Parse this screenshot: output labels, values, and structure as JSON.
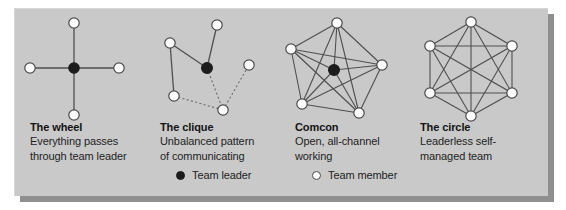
{
  "figure": {
    "background_color": "#c9c9c9",
    "shadow_color": "#8f8f8f",
    "page_color": "#ffffff",
    "node_fill_member": "#fbfbfb",
    "node_fill_leader": "#1c1c1c",
    "node_stroke": "#4a4a4a",
    "edge_color": "#4f4f4f"
  },
  "columns": [
    {
      "id": "wheel",
      "title": "The wheel",
      "description_lines": [
        "Everything passes",
        "through team leader"
      ],
      "diagram": {
        "name": "wheel-diagram",
        "leader_count": 1,
        "member_count": 4,
        "edge_style": "solid",
        "nodes": [
          {
            "id": "c",
            "type": "leader",
            "x": 60,
            "y": 60
          },
          {
            "id": "n",
            "type": "member",
            "x": 60,
            "y": 15
          },
          {
            "id": "e",
            "type": "member",
            "x": 105,
            "y": 60
          },
          {
            "id": "s",
            "type": "member",
            "x": 60,
            "y": 107
          },
          {
            "id": "w",
            "type": "member",
            "x": 16,
            "y": 60
          }
        ],
        "edges": [
          {
            "from": "c",
            "to": "n",
            "style": "solid"
          },
          {
            "from": "c",
            "to": "e",
            "style": "solid"
          },
          {
            "from": "c",
            "to": "s",
            "style": "solid"
          },
          {
            "from": "c",
            "to": "w",
            "style": "solid"
          }
        ]
      }
    },
    {
      "id": "clique",
      "title": "The clique",
      "description_lines": [
        "Unbalanced pattern",
        "of communicating"
      ],
      "diagram": {
        "name": "clique-diagram",
        "leader_count": 1,
        "member_count": 5,
        "edge_style": "mixed",
        "nodes": [
          {
            "id": "L",
            "type": "leader",
            "x": 60,
            "y": 60
          },
          {
            "id": "a",
            "type": "member",
            "x": 70,
            "y": 17
          },
          {
            "id": "b",
            "type": "member",
            "x": 23,
            "y": 35
          },
          {
            "id": "c",
            "type": "member",
            "x": 27,
            "y": 88
          },
          {
            "id": "d",
            "type": "member",
            "x": 76,
            "y": 102
          },
          {
            "id": "e",
            "type": "member",
            "x": 102,
            "y": 57
          }
        ],
        "edges": [
          {
            "from": "L",
            "to": "a",
            "style": "solid"
          },
          {
            "from": "L",
            "to": "b",
            "style": "solid"
          },
          {
            "from": "b",
            "to": "c",
            "style": "solid"
          },
          {
            "from": "L",
            "to": "d",
            "style": "dotted"
          },
          {
            "from": "c",
            "to": "d",
            "style": "dotted"
          },
          {
            "from": "d",
            "to": "e",
            "style": "dotted"
          }
        ]
      }
    },
    {
      "id": "comcon",
      "title": "Comcon",
      "description_lines": [
        "Open, all-channel",
        "working"
      ],
      "diagram": {
        "name": "comcon-diagram",
        "leader_count": 1,
        "member_count": 5,
        "edge_style": "solid",
        "fully_connected": true,
        "nodes": [
          {
            "id": "L",
            "type": "leader",
            "x": 54,
            "y": 62
          },
          {
            "id": "p1",
            "type": "member",
            "x": 57,
            "y": 15
          },
          {
            "id": "p2",
            "type": "member",
            "x": 102,
            "y": 57
          },
          {
            "id": "p3",
            "type": "member",
            "x": 79,
            "y": 105
          },
          {
            "id": "p4",
            "type": "member",
            "x": 22,
            "y": 96
          },
          {
            "id": "p5",
            "type": "member",
            "x": 11,
            "y": 41
          }
        ]
      }
    },
    {
      "id": "circle",
      "title": "The circle",
      "description_lines": [
        "Leaderless self-",
        "managed team"
      ],
      "diagram": {
        "name": "circle-diagram",
        "leader_count": 0,
        "member_count": 6,
        "edge_style": "solid",
        "fully_connected": true,
        "nodes": [
          {
            "id": "h1",
            "type": "member",
            "x": 58,
            "y": 14
          },
          {
            "id": "h2",
            "type": "member",
            "x": 99,
            "y": 38
          },
          {
            "id": "h3",
            "type": "member",
            "x": 99,
            "y": 85
          },
          {
            "id": "h4",
            "type": "member",
            "x": 58,
            "y": 108
          },
          {
            "id": "h5",
            "type": "member",
            "x": 17,
            "y": 85
          },
          {
            "id": "h6",
            "type": "member",
            "x": 17,
            "y": 38
          }
        ]
      }
    }
  ],
  "legend": {
    "leader": {
      "label": "Team leader",
      "marker": "filled-circle-icon"
    },
    "member": {
      "label": "Team member",
      "marker": "hollow-circle-icon"
    }
  }
}
